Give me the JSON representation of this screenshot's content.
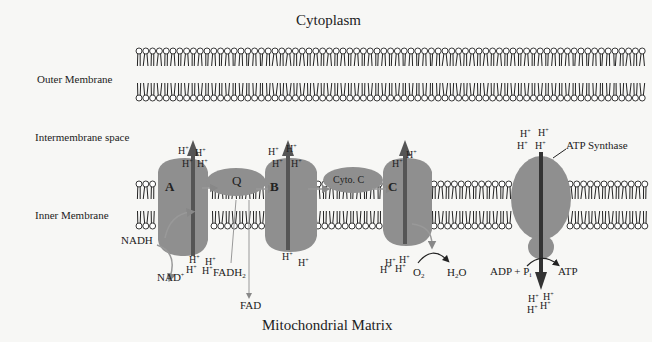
{
  "title_top": "Cytoplasm",
  "title_bottom": "Mitochondrial Matrix",
  "side_labels": {
    "outer_membrane": "Outer Membrane",
    "intermembrane_space": "Intermembrane space",
    "inner_membrane": "Inner Membrane"
  },
  "complexes": {
    "a": "A",
    "q": "Q",
    "b": "B",
    "cyto_c": "Cyto. C",
    "c": "C",
    "atp_synthase": "ATP Synthase"
  },
  "molecules": {
    "nadh": "NADH",
    "nad_plus": "NAD",
    "nad_sup": "+",
    "fadh2": "FADH",
    "fadh2_sub": "2",
    "fad": "FAD",
    "o2": "O",
    "o2_sub": "2",
    "h2o_h": "H",
    "h2o_sub": "2",
    "h2o_o": "O",
    "adp_pi": "ADP + P",
    "pi_sub": "i",
    "atp": "ATP"
  },
  "proton": "H",
  "proton_charge": "+",
  "colors": {
    "protein": "#8f8f8f",
    "arrow": "#555555",
    "lipid_head": "#ffffff",
    "lipid_stroke": "#222222",
    "background": "#f7f7f5"
  }
}
